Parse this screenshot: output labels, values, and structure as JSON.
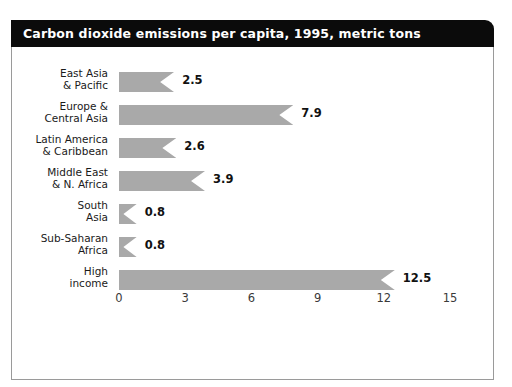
{
  "title": "Carbon dioxide emissions per capita, 1995, metric tons",
  "colors": {
    "bar_fill": "#a9a9a9",
    "title_bar_background": "#0b0b0b",
    "title_text": "#ffffff",
    "frame_border": "#9a9a9a",
    "label_text": "#1a1a1a",
    "tick_text": "#3a3a3a"
  },
  "chart_data": {
    "type": "bar",
    "orientation": "horizontal",
    "title": "Carbon dioxide emissions per capita, 1995, metric tons",
    "xlabel": "",
    "ylabel": "",
    "xlim": [
      0,
      15
    ],
    "xticks": [
      "0",
      "3",
      "6",
      "9",
      "12",
      "15"
    ],
    "xtick_values": [
      0,
      3,
      6,
      9,
      12,
      15
    ],
    "grid": false,
    "legend": false,
    "units": "metric tons",
    "year": "1995",
    "categories": [
      "East Asia & Pacific",
      "Europe & Central Asia",
      "Latin America & Caribbean",
      "Middle East & N. Africa",
      "South Asia",
      "Sub-Saharan Africa",
      "High income"
    ],
    "category_lines": [
      [
        "East Asia",
        "& Pacific"
      ],
      [
        "Europe &",
        "Central Asia"
      ],
      [
        "Latin America",
        "& Caribbean"
      ],
      [
        "Middle East",
        "& N. Africa"
      ],
      [
        "South",
        "Asia"
      ],
      [
        "Sub-Saharan",
        "Africa"
      ],
      [
        "High",
        "income"
      ]
    ],
    "values": [
      2.5,
      7.9,
      2.6,
      3.9,
      0.8,
      0.8,
      12.5
    ],
    "value_labels": [
      "2.5",
      "7.9",
      "2.6",
      "3.9",
      "0.8",
      "0.8",
      "12.5"
    ]
  }
}
